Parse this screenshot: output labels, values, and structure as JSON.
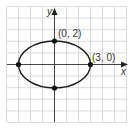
{
  "chart_data": {
    "type": "scatter",
    "title": "",
    "xlabel": "x",
    "ylabel": "y",
    "grid": true,
    "xlim": [
      -4.5,
      5.5
    ],
    "ylim": [
      -5,
      5
    ],
    "curve": {
      "kind": "ellipse",
      "center": [
        0,
        0
      ],
      "semi_axis_x": 3,
      "semi_axis_y": 2,
      "equation": "x^2/9 + y^2/4 = 1"
    },
    "points": [
      {
        "x": 0,
        "y": 2,
        "label": "(0, 2)"
      },
      {
        "x": 3,
        "y": 0,
        "label": "(3, 0)"
      },
      {
        "x": -3,
        "y": 0,
        "label": ""
      },
      {
        "x": 0,
        "y": -2,
        "label": ""
      }
    ],
    "colors": {
      "grid": "#d0d0d0",
      "axis": "#444444",
      "curve": "#1a1a1a",
      "point": "#111111"
    }
  },
  "labels": {
    "x_axis": "x",
    "y_axis": "y",
    "point_top": "(0, 2)",
    "point_right": "(3, 0)"
  }
}
